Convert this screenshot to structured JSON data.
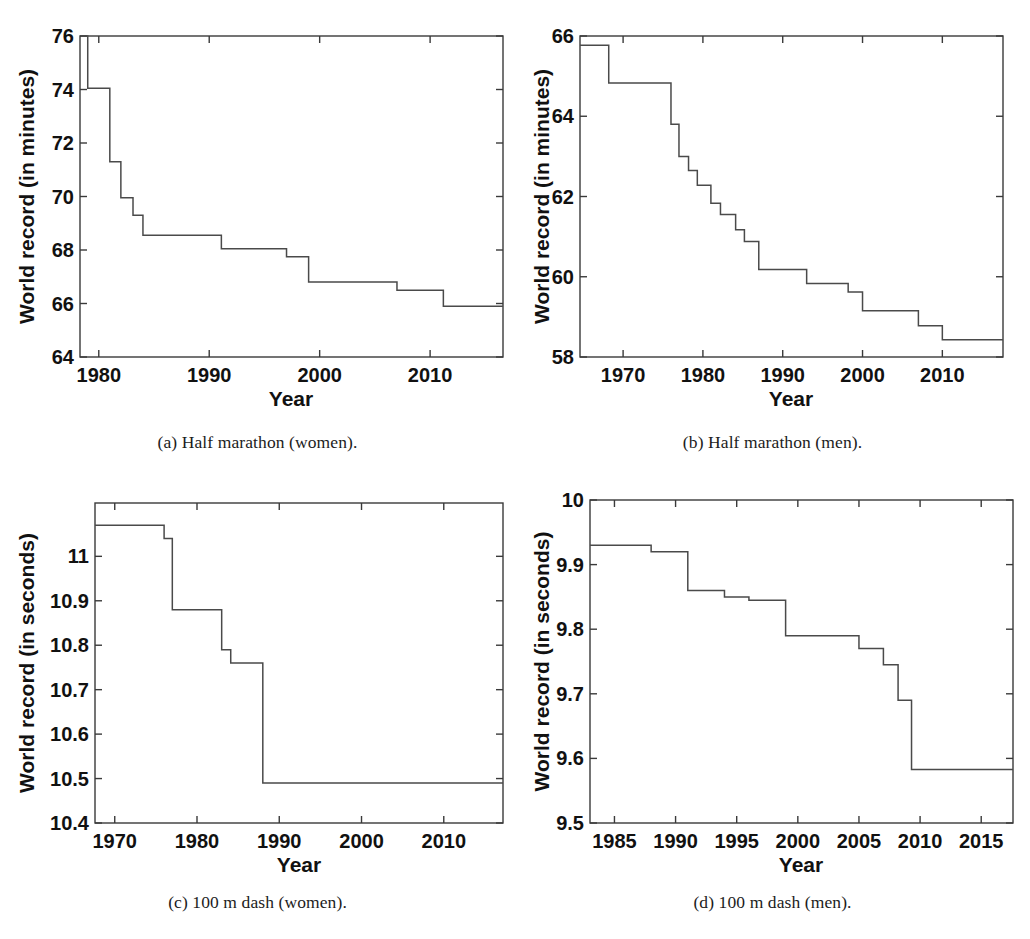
{
  "figure": {
    "panels": [
      {
        "id": "a",
        "caption": "(a) Half marathon (women).",
        "xlabel": "Year",
        "ylabel": "World record (in minutes)"
      },
      {
        "id": "b",
        "caption": "(b) Half marathon (men).",
        "xlabel": "Year",
        "ylabel": "World record (in minutes)"
      },
      {
        "id": "c",
        "caption": "(c) 100 m dash (women).",
        "xlabel": "Year",
        "ylabel": "World record (in seconds)"
      },
      {
        "id": "d",
        "caption": "(d) 100 m dash (men).",
        "xlabel": "Year",
        "ylabel": "World record (in seconds)"
      }
    ]
  },
  "chart_data": [
    {
      "type": "line",
      "subplot": "a",
      "title": "(a) Half marathon (women).",
      "xlabel": "Year",
      "ylabel": "World record (in minutes)",
      "xlim": [
        1978.3,
        2016.6
      ],
      "ylim": [
        64,
        76
      ],
      "xticks": [
        1980,
        1990,
        2000,
        2010
      ],
      "xtick_labels": [
        "1980",
        "1990",
        "2000",
        "2010"
      ],
      "yticks": [
        64,
        66,
        68,
        70,
        72,
        74,
        76
      ],
      "ytick_labels": [
        "64",
        "66",
        "68",
        "70",
        "72",
        "74",
        "76"
      ],
      "grid": false,
      "legend": null,
      "drawstyle": "steps-post",
      "x": [
        1978.4,
        1979.0,
        1981.0,
        1982.0,
        1983.1,
        1984.0,
        1991.1,
        1997.0,
        1999.0,
        2007.0,
        2011.2,
        2016.6
      ],
      "y": [
        76.0,
        74.05,
        71.3,
        69.95,
        69.3,
        68.55,
        68.05,
        67.75,
        66.8,
        66.5,
        65.9,
        65.9
      ]
    },
    {
      "type": "line",
      "subplot": "b",
      "title": "(b) Half marathon (men).",
      "xlabel": "Year",
      "ylabel": "World record (in minutes)",
      "xlim": [
        1964.6,
        2017.6
      ],
      "ylim": [
        58,
        66
      ],
      "xticks": [
        1970,
        1980,
        1990,
        2000,
        2010
      ],
      "xtick_labels": [
        "1970",
        "1980",
        "1990",
        "2000",
        "2010"
      ],
      "yticks": [
        58,
        60,
        62,
        64,
        66
      ],
      "ytick_labels": [
        "58",
        "60",
        "62",
        "64",
        "66"
      ],
      "grid": false,
      "legend": null,
      "drawstyle": "steps-post",
      "x": [
        1964.6,
        1968.2,
        1976.0,
        1977.0,
        1978.2,
        1979.3,
        1981.0,
        1982.2,
        1984.1,
        1985.2,
        1987.0,
        1993.0,
        1998.2,
        2000.0,
        2007.0,
        2010.0,
        2017.6
      ],
      "y": [
        65.77,
        64.83,
        63.8,
        63.0,
        62.65,
        62.28,
        61.83,
        61.55,
        61.17,
        60.88,
        60.18,
        59.83,
        59.62,
        59.15,
        58.78,
        58.43,
        58.43
      ]
    },
    {
      "type": "line",
      "subplot": "c",
      "title": "(c) 100 m dash (women).",
      "xlabel": "Year",
      "ylabel": "World record (in seconds)",
      "xlim": [
        1967.6,
        2017.2
      ],
      "ylim": [
        10.4,
        11.12
      ],
      "xticks": [
        1970,
        1980,
        1990,
        2000,
        2010
      ],
      "xtick_labels": [
        "1970",
        "1980",
        "1990",
        "2000",
        "2010"
      ],
      "yticks": [
        10.4,
        10.5,
        10.6,
        10.7,
        10.8,
        10.9,
        11.0
      ],
      "ytick_labels": [
        "10.4",
        "10.5",
        "10.6",
        "10.7",
        "10.8",
        "10.9",
        "11"
      ],
      "grid": false,
      "legend": null,
      "drawstyle": "steps-post",
      "x": [
        1967.6,
        1976.0,
        1977.0,
        1983.0,
        1984.1,
        1988.0,
        2017.2
      ],
      "y": [
        11.07,
        11.04,
        10.88,
        10.79,
        10.76,
        10.49,
        10.49
      ]
    },
    {
      "type": "line",
      "subplot": "d",
      "title": "(d) 100 m dash (men).",
      "xlabel": "Year",
      "ylabel": "World record (in seconds)",
      "xlim": [
        1983.0,
        2017.6
      ],
      "ylim": [
        9.5,
        10.0
      ],
      "xticks": [
        1985,
        1990,
        1995,
        2000,
        2005,
        2010,
        2015
      ],
      "xtick_labels": [
        "1985",
        "1990",
        "1995",
        "2000",
        "2005",
        "2010",
        "2015"
      ],
      "yticks": [
        9.5,
        9.6,
        9.7,
        9.8,
        9.9,
        10.0
      ],
      "ytick_labels": [
        "9.5",
        "9.6",
        "9.7",
        "9.8",
        "9.9",
        "10"
      ],
      "grid": false,
      "legend": null,
      "drawstyle": "steps-post",
      "x": [
        1983.0,
        1988.0,
        1991.0,
        1994.0,
        1996.0,
        1999.0,
        2005.0,
        2007.0,
        2008.2,
        2009.3,
        2017.6
      ],
      "y": [
        9.93,
        9.92,
        9.86,
        9.85,
        9.845,
        9.79,
        9.77,
        9.745,
        9.69,
        9.583,
        9.583
      ]
    }
  ]
}
